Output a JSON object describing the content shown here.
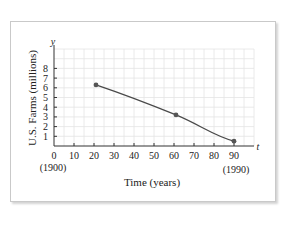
{
  "chart_data": {
    "type": "line",
    "title": "",
    "xlabel": "Time (years)",
    "ylabel": "U.S. Farms (millions)",
    "x_axis_symbol": "t",
    "y_axis_symbol": "y",
    "x_ticks": [
      0,
      10,
      20,
      30,
      40,
      50,
      60,
      70,
      80,
      90
    ],
    "y_ticks": [
      1,
      2,
      3,
      4,
      5,
      6,
      7,
      8
    ],
    "x_tick_annotations": [
      {
        "x": 0,
        "label": "(1900)"
      },
      {
        "x": 90,
        "label": "(1990)"
      }
    ],
    "xlim": [
      0,
      100
    ],
    "ylim": [
      0,
      10
    ],
    "grid": true,
    "legend": null,
    "series": [
      {
        "name": "U.S. Farms",
        "points": [
          {
            "t": 21,
            "y": 6.3
          },
          {
            "t": 61,
            "y": 3.2
          },
          {
            "t": 90,
            "y": 0.5
          }
        ],
        "smooth": true,
        "marker": "dot"
      }
    ]
  },
  "colors": {
    "axis": "#333333",
    "grid": "#e4e4e4",
    "curve": "#4a4a4a",
    "marker": "#555555",
    "text": "#222222"
  },
  "labels": {
    "ylabel": "U.S. Farms (millions)",
    "xlabel": "Time (years)",
    "y_symbol": "y",
    "t_symbol": "t",
    "year_start": "(1900)",
    "year_end": "(1990)"
  }
}
